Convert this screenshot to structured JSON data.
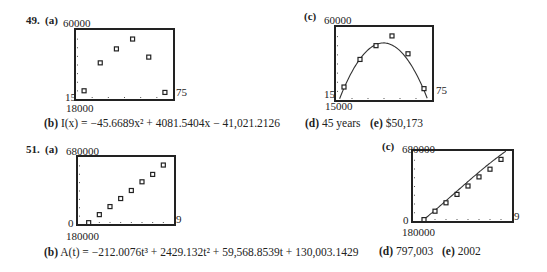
{
  "problems": [
    {
      "number": "49.",
      "a": {
        "label": "(a)",
        "ymax": "60000",
        "ymin": "18000",
        "xmin": "15",
        "xmax": "75"
      },
      "b": {
        "label": "(b)",
        "lhs": "I(x)",
        "equation": "I(x) = −45.6689x² + 4081.5404x − 41,021.2126"
      },
      "c": {
        "label": "(c)",
        "ymax": "60000",
        "ymin": "15000",
        "xmin": "15",
        "xmax": "75"
      },
      "d": {
        "label": "(d)",
        "text": "45 years"
      },
      "e": {
        "label": "(e)",
        "text": "$50,173"
      }
    },
    {
      "number": "51.",
      "a": {
        "label": "(a)",
        "ymax": "680000",
        "ymin": "180000",
        "xmin": "0",
        "xmax": "9"
      },
      "b": {
        "label": "(b)",
        "lhs": "A(t)",
        "equation": "A(t) = −212.0076t³ + 2429.132t² + 59,568.8539t + 130,003.1429"
      },
      "c": {
        "label": "(c)",
        "ymax": "680000",
        "ymin": "180000",
        "xmin": "0",
        "xmax": "9"
      },
      "d": {
        "label": "(d)",
        "text": "797,003"
      },
      "e": {
        "label": "(e)",
        "text": "2002"
      }
    }
  ],
  "chart_data": [
    {
      "type": "scatter",
      "title": "49(a)",
      "x": [
        20,
        30,
        40,
        50,
        60,
        70
      ],
      "values": [
        23000,
        40000,
        48500,
        54500,
        43500,
        22000
      ],
      "xlim": [
        15,
        75
      ],
      "ylim": [
        18000,
        60000
      ],
      "xlabel": "",
      "ylabel": "",
      "grid": false
    },
    {
      "type": "scatter",
      "title": "49(c)",
      "x": [
        20,
        30,
        40,
        50,
        60,
        70
      ],
      "values": [
        23000,
        40000,
        48500,
        54500,
        43500,
        22000
      ],
      "fit": "I(x) = -45.6689x^2 + 4081.5404x - 41021.2126",
      "xlim": [
        15,
        75
      ],
      "ylim": [
        15000,
        60000
      ],
      "xlabel": "",
      "ylabel": "",
      "grid": false
    },
    {
      "type": "scatter",
      "title": "51(a)",
      "x": [
        1,
        2,
        3,
        4,
        5,
        6,
        7,
        8
      ],
      "values": [
        190000,
        250000,
        310000,
        370000,
        430000,
        495000,
        550000,
        620000
      ],
      "xlim": [
        0,
        9
      ],
      "ylim": [
        180000,
        680000
      ],
      "xlabel": "",
      "ylabel": "",
      "grid": false
    },
    {
      "type": "scatter",
      "title": "51(c)",
      "x": [
        1,
        2,
        3,
        4,
        5,
        6,
        7,
        8
      ],
      "values": [
        190000,
        250000,
        310000,
        370000,
        430000,
        495000,
        550000,
        620000
      ],
      "fit": "A(t) = -212.0076t^3 + 2429.132t^2 + 59568.8539t + 130003.1429",
      "xlim": [
        0,
        9
      ],
      "ylim": [
        180000,
        680000
      ],
      "xlabel": "",
      "ylabel": "",
      "grid": false
    }
  ]
}
